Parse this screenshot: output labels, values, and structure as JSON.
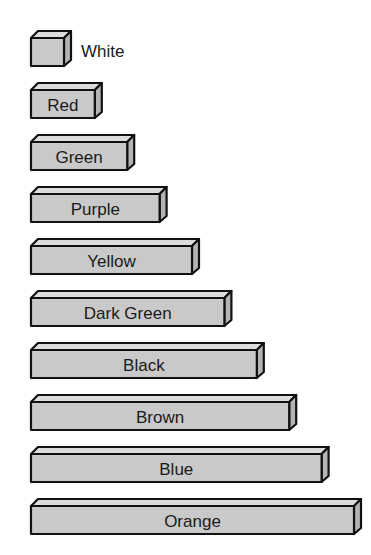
{
  "diagram": {
    "type": "cuisenaire-rods",
    "colors": {
      "front": "#c9c9c9",
      "top": "#dcdcdc",
      "side": "#b4b4b4",
      "outline": "#111111",
      "text": "#1a1a1a"
    },
    "rods": [
      {
        "label": "White",
        "length": 1
      },
      {
        "label": "Red",
        "length": 2
      },
      {
        "label": "Green",
        "length": 3
      },
      {
        "label": "Purple",
        "length": 4
      },
      {
        "label": "Yellow",
        "length": 5
      },
      {
        "label": "Dark Green",
        "length": 6
      },
      {
        "label": "Black",
        "length": 7
      },
      {
        "label": "Brown",
        "length": 8
      },
      {
        "label": "Blue",
        "length": 9
      },
      {
        "label": "Orange",
        "length": 10
      }
    ]
  }
}
